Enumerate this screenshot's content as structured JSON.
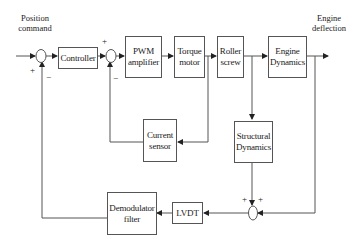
{
  "diagram": {
    "type": "block-diagram",
    "input_label_line1": "Position",
    "input_label_line2": "command",
    "output_label_line1": "Engine",
    "output_label_line2": "deflection",
    "blocks": {
      "controller": "Controller",
      "pwm_line1": "PWM",
      "pwm_line2": "amplifier",
      "torque_line1": "Torque",
      "torque_line2": "motor",
      "roller_line1": "Roller",
      "roller_line2": "screw",
      "engine_line1": "Engine",
      "engine_line2": "Dynamics",
      "current_line1": "Current",
      "current_line2": "sensor",
      "structural_line1": "Structural",
      "structural_line2": "Dynamics",
      "lvdt": "LVDT",
      "demod_line1": "Demodulator",
      "demod_line2": "filter"
    },
    "signs": {
      "sum1_in": "+",
      "sum1_fb": "−",
      "sum2_in": "+",
      "sum2_fb": "−",
      "sum3_left": "+",
      "sum3_right": "+"
    },
    "connections": [
      {
        "from": "Position command",
        "to": "Sum1"
      },
      {
        "from": "Sum1",
        "to": "Controller"
      },
      {
        "from": "Controller",
        "to": "Sum2"
      },
      {
        "from": "Sum2",
        "to": "PWM amplifier"
      },
      {
        "from": "PWM amplifier",
        "to": "Torque motor"
      },
      {
        "from": "Torque motor",
        "to": "Roller screw"
      },
      {
        "from": "Roller screw",
        "to": "Engine Dynamics"
      },
      {
        "from": "Engine Dynamics",
        "to": "Engine deflection"
      },
      {
        "from": "Torque motor",
        "to": "Current sensor"
      },
      {
        "from": "Current sensor",
        "to": "Sum2"
      },
      {
        "from": "Roller screw",
        "to": "Structural Dynamics"
      },
      {
        "from": "Structural Dynamics",
        "to": "Sum3"
      },
      {
        "from": "Engine Dynamics",
        "to": "Sum3"
      },
      {
        "from": "Sum3",
        "to": "LVDT"
      },
      {
        "from": "LVDT",
        "to": "Demodulator filter"
      },
      {
        "from": "Demodulator filter",
        "to": "Sum1"
      }
    ]
  }
}
